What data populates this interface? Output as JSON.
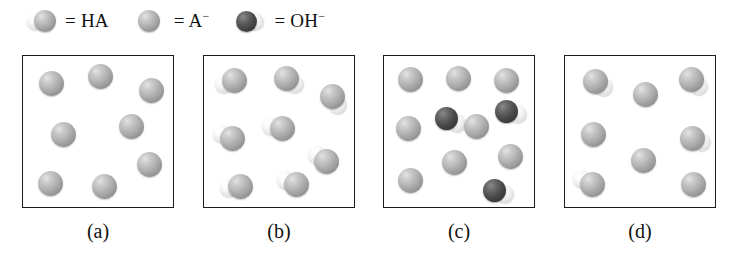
{
  "figure": {
    "background_color": "#ffffff",
    "border_color": "#1b1b1b"
  },
  "legend": {
    "items": [
      {
        "glyph": "ha-molecule-icon",
        "equals": "=",
        "label": "HA",
        "charge": "",
        "description": "small white hydrogen sphere bonded to grey A sphere",
        "colors": {
          "grey": "#b2b2b2",
          "white": "#f2f2f2"
        }
      },
      {
        "glyph": "a-anion-icon",
        "equals": "=",
        "label": "A",
        "charge": "−",
        "description": "single grey sphere",
        "colors": {
          "grey": "#b2b2b2"
        }
      },
      {
        "glyph": "oh-anion-icon",
        "equals": "=",
        "label": "OH",
        "charge": "−",
        "description": "dark oxygen sphere bonded to white hydrogen sphere",
        "colors": {
          "dark": "#3f3f3f",
          "white": "#f2f2f2"
        }
      }
    ]
  },
  "panels": [
    {
      "id": "a",
      "caption": "(a)",
      "counts": {
        "HA": 0,
        "A-": 8,
        "OH-": 0
      },
      "particles": [
        {
          "type": "A-",
          "x": 28,
          "y": 27
        },
        {
          "type": "A-",
          "x": 77,
          "y": 20
        },
        {
          "type": "A-",
          "x": 128,
          "y": 34
        },
        {
          "type": "A-",
          "x": 40,
          "y": 78
        },
        {
          "type": "A-",
          "x": 108,
          "y": 70
        },
        {
          "type": "A-",
          "x": 27,
          "y": 127
        },
        {
          "type": "A-",
          "x": 81,
          "y": 130
        },
        {
          "type": "A-",
          "x": 126,
          "y": 108
        }
      ]
    },
    {
      "id": "b",
      "caption": "(b)",
      "counts": {
        "HA": 8,
        "A-": 0,
        "OH-": 0
      },
      "particles": [
        {
          "type": "HA",
          "x": 30,
          "y": 24,
          "angle": 160
        },
        {
          "type": "HA",
          "x": 82,
          "y": 22,
          "angle": 35
        },
        {
          "type": "HA",
          "x": 128,
          "y": 40,
          "angle": 55
        },
        {
          "type": "HA",
          "x": 28,
          "y": 82,
          "angle": 200
        },
        {
          "type": "HA",
          "x": 78,
          "y": 72,
          "angle": 190
        },
        {
          "type": "HA",
          "x": 122,
          "y": 105,
          "angle": 215
        },
        {
          "type": "HA",
          "x": 36,
          "y": 130,
          "angle": 170
        },
        {
          "type": "HA",
          "x": 92,
          "y": 128,
          "angle": 200
        }
      ]
    },
    {
      "id": "c",
      "caption": "(c)",
      "counts": {
        "HA": 0,
        "A-": 8,
        "OH-": 3
      },
      "particles": [
        {
          "type": "A-",
          "x": 26,
          "y": 23
        },
        {
          "type": "A-",
          "x": 74,
          "y": 22
        },
        {
          "type": "A-",
          "x": 122,
          "y": 24
        },
        {
          "type": "OH-",
          "x": 62,
          "y": 62,
          "angle": 25
        },
        {
          "type": "OH-",
          "x": 122,
          "y": 55,
          "angle": 15
        },
        {
          "type": "A-",
          "x": 24,
          "y": 72
        },
        {
          "type": "A-",
          "x": 92,
          "y": 70
        },
        {
          "type": "A-",
          "x": 70,
          "y": 106
        },
        {
          "type": "A-",
          "x": 126,
          "y": 100
        },
        {
          "type": "A-",
          "x": 26,
          "y": 124
        },
        {
          "type": "OH-",
          "x": 110,
          "y": 134,
          "angle": 20
        }
      ]
    },
    {
      "id": "d",
      "caption": "(d)",
      "counts": {
        "HA": 4,
        "A-": 4,
        "OH-": 0
      },
      "particles": [
        {
          "type": "HA",
          "x": 30,
          "y": 25,
          "angle": 35
        },
        {
          "type": "A-",
          "x": 80,
          "y": 38
        },
        {
          "type": "HA",
          "x": 126,
          "y": 23,
          "angle": 40
        },
        {
          "type": "A-",
          "x": 28,
          "y": 78
        },
        {
          "type": "HA",
          "x": 127,
          "y": 82,
          "angle": 20
        },
        {
          "type": "A-",
          "x": 78,
          "y": 104
        },
        {
          "type": "HA",
          "x": 27,
          "y": 128,
          "angle": 210
        },
        {
          "type": "A-",
          "x": 128,
          "y": 128
        }
      ]
    }
  ]
}
